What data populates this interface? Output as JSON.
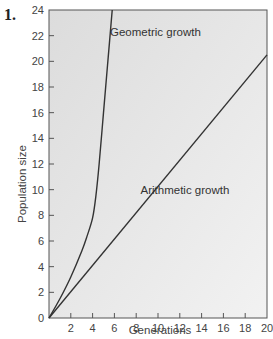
{
  "figure_number": "1.",
  "chart_data": {
    "type": "line",
    "title": "",
    "xlabel": "Generations",
    "ylabel": "Population size",
    "xlim": [
      0,
      20
    ],
    "ylim": [
      0,
      24
    ],
    "x_ticks": [
      2,
      4,
      6,
      8,
      10,
      12,
      14,
      16,
      18,
      20
    ],
    "y_ticks": [
      0,
      2,
      4,
      6,
      8,
      10,
      12,
      14,
      16,
      18,
      20,
      22,
      24
    ],
    "grid": false,
    "background": "#e8e8e8",
    "series": [
      {
        "name": "Geometric growth",
        "x": [
          0,
          1,
          2,
          3,
          3.5,
          4,
          4.3,
          4.6,
          5,
          5.4,
          5.8
        ],
        "y": [
          0,
          1.5,
          3.2,
          5.2,
          6.4,
          7.8,
          9.5,
          12,
          16,
          20,
          24
        ]
      },
      {
        "name": "Arithmetic growth",
        "x": [
          0,
          20
        ],
        "y": [
          0,
          20.5
        ]
      }
    ],
    "annotations": [
      {
        "text": "Geometric growth",
        "x": 5.6,
        "y": 22
      },
      {
        "text": "Arithmetic growth",
        "x": 8.4,
        "y": 9.7
      }
    ]
  }
}
